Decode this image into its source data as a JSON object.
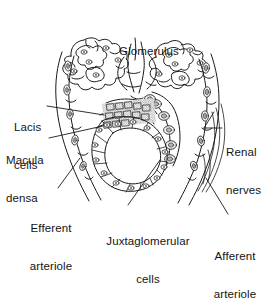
{
  "figure": {
    "kind": "anatomical-line-diagram",
    "style": "black-and-white pen-and-ink line drawing with stippled shading",
    "background_color": "#ffffff",
    "line_color": "#1a1a1a",
    "shading_color": "#8a8a8a"
  },
  "labels": {
    "glomerulus": "Glomerulus",
    "lacis_cells_line1": "Lacis",
    "lacis_cells_line2": "cells",
    "macula_densa_line1": "Macula",
    "macula_densa_line2": "densa",
    "renal_nerves_line1": "Renal",
    "renal_nerves_line2": "nerves",
    "efferent_arteriole_line1": "Efferent",
    "efferent_arteriole_line2": "arteriole",
    "juxtaglomerular_cells_line1": "Juxtaglomerular",
    "juxtaglomerular_cells_line2": "cells",
    "afferent_arteriole_line1": "Afferent",
    "afferent_arteriole_line2": "arteriole"
  },
  "structures": [
    {
      "name": "glomerulus",
      "description": "Lobulated capillary tufts with oval endothelial nuclei, upper region"
    },
    {
      "name": "lacis-cells",
      "description": "Dense cluster of small extraglomerular mesangial cells at the vascular pole"
    },
    {
      "name": "macula-densa",
      "description": "Ring of tall columnar tubular cells forming a lumen, center"
    },
    {
      "name": "juxtaglomerular-cells",
      "description": "Granular cells in the arteriole wall"
    },
    {
      "name": "afferent-arteriole",
      "description": "Vessel descending to the lower right"
    },
    {
      "name": "efferent-arteriole",
      "description": "Vessel descending to the lower left"
    },
    {
      "name": "renal-nerves",
      "description": "Nerve fibers along the right arteriole"
    }
  ]
}
